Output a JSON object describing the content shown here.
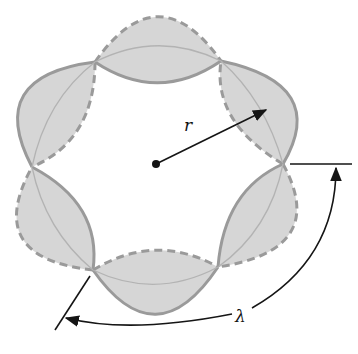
{
  "figure": {
    "type": "vibrating ring standing wave diagram",
    "labels": {
      "radius": "r",
      "wavelength": "λ"
    },
    "colors": {
      "lobe_fill": "#d6d6d6",
      "lobe_outline": "#9a9a9a",
      "ink": "#151515"
    },
    "lobes": [
      {
        "name": "top",
        "outer": "dashed",
        "inner": "solid"
      },
      {
        "name": "top-right",
        "outer": "solid",
        "inner": "dashed"
      },
      {
        "name": "bottom-right",
        "outer": "dashed",
        "inner": "solid"
      },
      {
        "name": "bottom",
        "outer": "solid",
        "inner": "dashed"
      },
      {
        "name": "bottom-left",
        "outer": "dashed",
        "inner": "solid"
      },
      {
        "name": "top-left",
        "outer": "solid",
        "inner": "dashed"
      }
    ],
    "node_count": 6
  }
}
